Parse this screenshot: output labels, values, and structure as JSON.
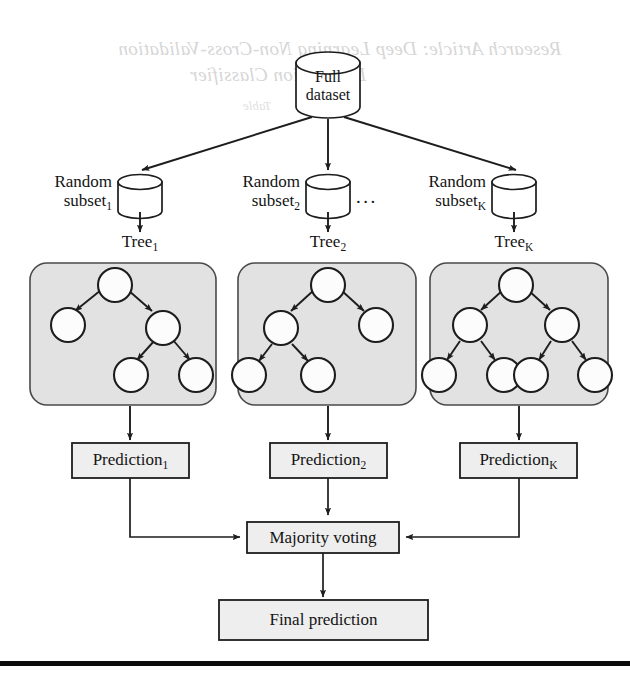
{
  "figure": {
    "colors": {
      "panel_fill": "#e2e2e2",
      "panel_stroke": "#4a4a4a",
      "box_fill": "#eeeeee",
      "stroke": "#1d1d1d",
      "node_fill": "#fcfcfc",
      "bleed_text": "#cfcfcf",
      "page_background": "#ffffff"
    }
  },
  "bleed_through": {
    "line1": "Research Article: Deep Learning Non-Cross-Validation",
    "line2": "Destination Classifier",
    "line3": "Table"
  },
  "source": {
    "label_line1": "Full",
    "label_line2": "dataset",
    "name": "full-dataset"
  },
  "subsets": [
    {
      "label_line1": "Random",
      "label_line2": "subset",
      "subscript": "1"
    },
    {
      "label_line1": "Random",
      "label_line2": "subset",
      "subscript": "2"
    },
    {
      "label_line1": "Random",
      "label_line2": "subset",
      "subscript": "K"
    }
  ],
  "ellipsis": "...",
  "trees": [
    {
      "label": "Tree",
      "subscript": "1",
      "node_count": 5,
      "shape": "right-heavy"
    },
    {
      "label": "Tree",
      "subscript": "2",
      "node_count": 5,
      "shape": "left-heavy"
    },
    {
      "label": "Tree",
      "subscript": "K",
      "node_count": 7,
      "shape": "balanced"
    }
  ],
  "predictions": [
    {
      "label": "Prediction",
      "subscript": "1"
    },
    {
      "label": "Prediction",
      "subscript": "2"
    },
    {
      "label": "Prediction",
      "subscript": "K"
    }
  ],
  "aggregation": {
    "label": "Majority voting"
  },
  "output": {
    "label": "Final prediction"
  }
}
